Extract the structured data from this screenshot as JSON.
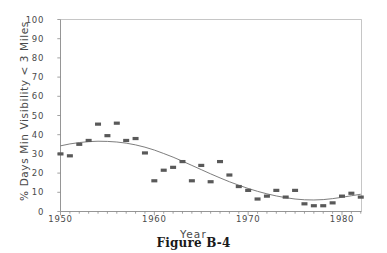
{
  "caption": "Figure B-4",
  "chart_data": {
    "type": "scatter",
    "title": "",
    "xlabel": "Year",
    "ylabel": "% Days Min Visibility < 3 Miles",
    "xlim": [
      1949,
      1983
    ],
    "ylim": [
      0,
      100
    ],
    "grid": false,
    "legend": "none",
    "xticks": [
      1950,
      1960,
      1970,
      1980
    ],
    "xtick_labels": [
      "1950",
      "1960",
      "1970",
      "1980"
    ],
    "minor_xtick_interval": 1,
    "yticks": [
      0,
      10,
      20,
      30,
      40,
      50,
      60,
      70,
      80,
      90,
      100
    ],
    "ytick_labels": [
      "0",
      "10",
      "20",
      "30",
      "40",
      "50",
      "60",
      "70",
      "80",
      "90",
      "100"
    ],
    "marker_color": "#595959",
    "line_color": "#6e6e6e",
    "axis_color": "#8a8a8a",
    "series": [
      {
        "name": "Observed % days min visibility < 3 miles",
        "type": "scatter",
        "x": [
          1950,
          1951,
          1952,
          1953,
          1954,
          1955,
          1956,
          1957,
          1958,
          1959,
          1960,
          1961,
          1962,
          1963,
          1964,
          1965,
          1966,
          1967,
          1968,
          1969,
          1970,
          1971,
          1972,
          1973,
          1974,
          1975,
          1976,
          1977,
          1978,
          1979,
          1980,
          1981,
          1982
        ],
        "values": [
          30,
          29,
          35,
          37,
          45.5,
          39.5,
          46,
          37,
          38,
          30.5,
          16,
          21.5,
          23,
          26,
          16,
          24,
          15.5,
          26,
          19,
          13,
          11,
          6.5,
          8,
          11,
          7.5,
          11,
          4,
          3,
          3,
          4.5,
          8,
          9.5,
          7.5
        ]
      },
      {
        "name": "Fitted trend curve",
        "type": "line",
        "x": [
          1950,
          1951,
          1952,
          1953,
          1954,
          1955,
          1956,
          1957,
          1958,
          1959,
          1960,
          1961,
          1962,
          1963,
          1964,
          1965,
          1966,
          1967,
          1968,
          1969,
          1970,
          1971,
          1972,
          1973,
          1974,
          1975,
          1976,
          1977,
          1978,
          1979,
          1980,
          1981,
          1982
        ],
        "values": [
          34.2,
          35.2,
          35.9,
          36.4,
          36.6,
          36.5,
          36.2,
          35.6,
          34.7,
          33.5,
          32.0,
          30.2,
          28.3,
          26.2,
          24.0,
          21.8,
          19.6,
          17.5,
          15.5,
          13.7,
          12.0,
          10.5,
          9.2,
          8.1,
          7.2,
          6.5,
          6.1,
          6.0,
          6.2,
          6.7,
          7.4,
          8.2,
          9.0
        ]
      }
    ]
  }
}
